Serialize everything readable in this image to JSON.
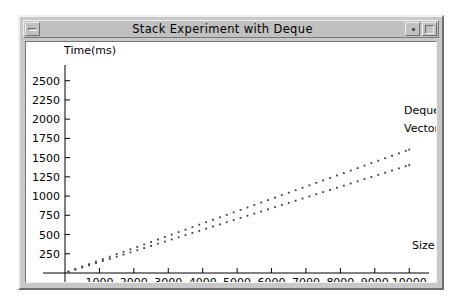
{
  "window": {
    "title": "Stack Experiment with Deque",
    "controls": {
      "minimize_label": "minimize-button",
      "restore_label": "restore-button",
      "maximize_label": "maximize-button"
    }
  },
  "chart_data": {
    "type": "scatter",
    "title": "Stack Experiment with Deque",
    "xlabel": "Size",
    "ylabel": "Time(ms)",
    "xlim": [
      0,
      10400
    ],
    "ylim": [
      0,
      2600
    ],
    "xticks": [
      1000,
      2000,
      3000,
      4000,
      5000,
      6000,
      7000,
      8000,
      9000,
      10000
    ],
    "xtick_labels": [
      "1000",
      "2000",
      "3000",
      "4000",
      "5000",
      "6000",
      "7000",
      "8000",
      "9000",
      "10000"
    ],
    "yticks": [
      250,
      500,
      750,
      1000,
      1250,
      1500,
      1750,
      2000,
      2250,
      2500
    ],
    "ytick_labels": [
      "250",
      "500",
      "750",
      "1000",
      "1250",
      "1500",
      "1750",
      "2000",
      "2250",
      "2500"
    ],
    "grid": false,
    "legend_position": "right",
    "series": [
      {
        "name": "Deque",
        "color": "#3b3b3b",
        "marker": "dot",
        "x": [
          100,
          300,
          500,
          700,
          900,
          1100,
          1300,
          1500,
          1700,
          1900,
          2100,
          2300,
          2500,
          2700,
          2900,
          3100,
          3300,
          3500,
          3700,
          3900,
          4100,
          4300,
          4500,
          4700,
          4900,
          5100,
          5300,
          5500,
          5700,
          5900,
          6100,
          6300,
          6500,
          6700,
          6900,
          7100,
          7300,
          7500,
          7700,
          7900,
          8100,
          8300,
          8500,
          8700,
          8900,
          9100,
          9300,
          9500,
          9700,
          9900,
          10000
        ],
        "y": [
          20,
          52,
          85,
          115,
          148,
          180,
          212,
          245,
          276,
          308,
          340,
          372,
          404,
          436,
          468,
          500,
          532,
          564,
          596,
          628,
          660,
          692,
          724,
          756,
          788,
          820,
          852,
          884,
          916,
          948,
          980,
          1012,
          1044,
          1076,
          1108,
          1140,
          1172,
          1204,
          1236,
          1268,
          1300,
          1332,
          1364,
          1396,
          1428,
          1460,
          1492,
          1524,
          1556,
          1588,
          1604
        ]
      },
      {
        "name": "Vector",
        "color": "#3b3b3b",
        "marker": "dot",
        "x": [
          100,
          300,
          500,
          700,
          900,
          1100,
          1300,
          1500,
          1700,
          1900,
          2100,
          2300,
          2500,
          2700,
          2900,
          3100,
          3300,
          3500,
          3700,
          3900,
          4100,
          4300,
          4500,
          4700,
          4900,
          5100,
          5300,
          5500,
          5700,
          5900,
          6100,
          6300,
          6500,
          6700,
          6900,
          7100,
          7300,
          7500,
          7700,
          7900,
          8100,
          8300,
          8500,
          8700,
          8900,
          9100,
          9300,
          9500,
          9700,
          9900,
          10000
        ],
        "y": [
          14,
          44,
          72,
          100,
          128,
          156,
          184,
          212,
          240,
          268,
          296,
          324,
          352,
          380,
          408,
          436,
          464,
          492,
          520,
          548,
          576,
          604,
          632,
          660,
          688,
          716,
          744,
          772,
          800,
          828,
          856,
          884,
          912,
          940,
          968,
          996,
          1024,
          1052,
          1080,
          1108,
          1136,
          1164,
          1192,
          1220,
          1248,
          1276,
          1304,
          1332,
          1360,
          1388,
          1402
        ]
      }
    ],
    "legend": [
      {
        "label": "Deque"
      },
      {
        "label": "Vector"
      }
    ]
  }
}
